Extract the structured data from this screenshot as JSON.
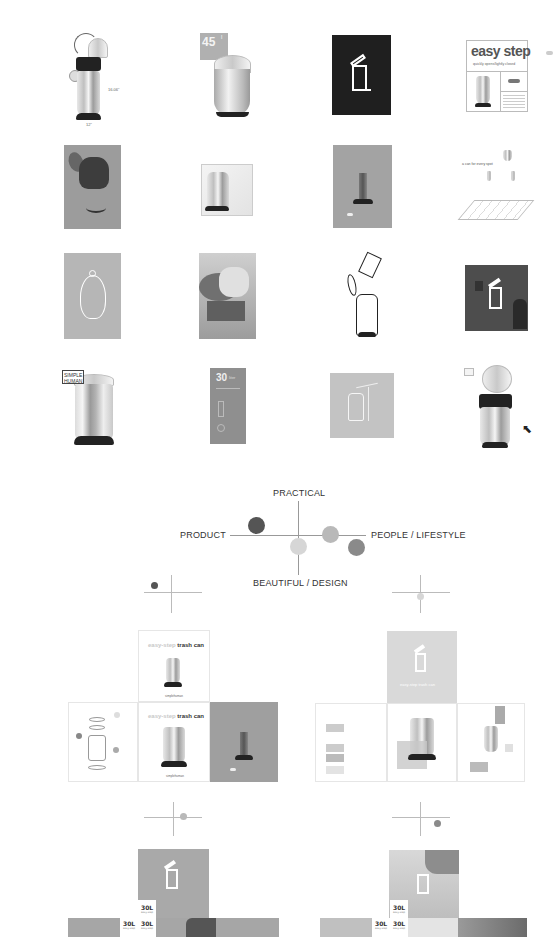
{
  "moodboard": {
    "row1": {
      "tile1": {
        "name": "open-lid-trash-can",
        "dimension_label": "16.06\"",
        "base_label": "12\""
      },
      "tile2": {
        "name": "capacity-card",
        "capacity": "45",
        "unit": "l"
      },
      "tile3": {
        "name": "trash-icon-dark-card"
      },
      "tile4": {
        "name": "easy-step-card",
        "title": "easy step",
        "subtitle": "quickly opens/lightly closed"
      }
    },
    "row2": {
      "tile1": {
        "name": "inner-bucket-exploded"
      },
      "tile2": {
        "name": "can-in-cube"
      },
      "tile3": {
        "name": "features-grey-card"
      },
      "tile4": {
        "name": "a-can-for-every-spot",
        "caption": "a can for every spot"
      }
    },
    "row3": {
      "tile1": {
        "name": "outline-can-grey"
      },
      "tile2": {
        "name": "hand-opening-lid-photo"
      },
      "tile3": {
        "name": "line-drawing-can-with-bag"
      },
      "tile4": {
        "name": "icon-over-photo-dark"
      }
    },
    "row4": {
      "tile1": {
        "name": "simple-human-can",
        "brand_line1": "SIMPLE",
        "brand_line2": "HUMAN"
      },
      "tile2": {
        "name": "30-liter-card",
        "capacity": "30",
        "unit": "liter"
      },
      "tile3": {
        "name": "outline-can-grey-square"
      },
      "tile4": {
        "name": "open-can-with-pedal"
      }
    }
  },
  "positioning_map": {
    "labels": {
      "top": "PRACTICAL",
      "left": "PRODUCT",
      "right": "PEOPLE / LIFESTYLE",
      "bottom": "BEAUTIFUL / DESIGN"
    },
    "dots": [
      {
        "name": "dot-dark",
        "color": "#555555"
      },
      {
        "name": "dot-light",
        "color": "#d6d6d6"
      },
      {
        "name": "dot-mid",
        "color": "#b9b9b9"
      },
      {
        "name": "dot-medium-dark",
        "color": "#8a8a8a"
      }
    ]
  },
  "concepts": {
    "concept_a": {
      "title_soft": "easy-step",
      "title_hard": "trash can",
      "brand_mark": "simplehuman"
    },
    "concept_b": {
      "title": "easy-step trash can"
    },
    "concept_c": {
      "volume_label": "30L",
      "volume_sub": "easy-step"
    },
    "concept_d": {
      "volume_label": "30L",
      "volume_sub": "easy-step"
    }
  }
}
